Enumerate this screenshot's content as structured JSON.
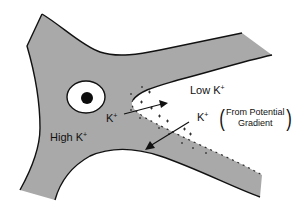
{
  "diagram": {
    "type": "ion-flow schematic",
    "colors": {
      "tissue_fill": "#a9a9a9",
      "outline": "#111111",
      "background": "#ffffff",
      "cell": "#ffffff",
      "nucleus": "#0d0d0d"
    },
    "labels": {
      "low_k": {
        "text": "Low K",
        "superscript": "+"
      },
      "high_k": {
        "text": "High K",
        "superscript": "+"
      },
      "k_in": {
        "text": "K",
        "superscript": "+"
      },
      "k_out": {
        "text": "K",
        "superscript": "+"
      },
      "annotation": {
        "line1": "From Potential",
        "line2": "Gradient",
        "open": "(",
        "close": ")"
      }
    },
    "charges": {
      "inside_symbol": "+",
      "outside_symbol": "-"
    },
    "arrows": [
      {
        "name": "k-influx-arrow",
        "direction": "into low K+ region"
      },
      {
        "name": "k-efflux-arrow",
        "direction": "back toward high K+ region"
      }
    ]
  }
}
